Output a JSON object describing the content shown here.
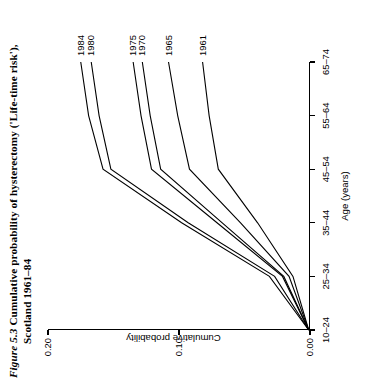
{
  "figure": {
    "number": "Figure 5.3",
    "caption_line1": "Cumulative probability of hysterectomy ('Life-time risk'),",
    "caption_line2": "Scotland 1961–84"
  },
  "chart_data": {
    "type": "line",
    "title": "Cumulative probability of hysterectomy ('Life-time risk'), Scotland 1961–84",
    "xlabel": "Age (years)",
    "ylabel": "Cumulative probability",
    "categories": [
      "10–24",
      "25–34",
      "35–44",
      "45–54",
      "55–64",
      "65–74"
    ],
    "ylim": [
      0.0,
      0.2
    ],
    "yticks": [
      "0.00",
      "0.10",
      "0.20"
    ],
    "ytick_values": [
      0.0,
      0.1,
      0.2
    ],
    "grid": false,
    "legend": "inline-end-labels",
    "series": [
      {
        "name": "1961",
        "values": [
          0.001,
          0.013,
          0.04,
          0.07,
          0.077,
          0.082
        ]
      },
      {
        "name": "1965",
        "values": [
          0.001,
          0.016,
          0.053,
          0.092,
          0.101,
          0.108
        ]
      },
      {
        "name": "1970",
        "values": [
          0.001,
          0.02,
          0.067,
          0.114,
          0.122,
          0.128
        ]
      },
      {
        "name": "1975",
        "values": [
          0.001,
          0.021,
          0.071,
          0.121,
          0.129,
          0.135
        ]
      },
      {
        "name": "1980",
        "values": [
          0.001,
          0.027,
          0.093,
          0.152,
          0.161,
          0.167
        ]
      },
      {
        "name": "1984",
        "values": [
          0.001,
          0.031,
          0.098,
          0.158,
          0.169,
          0.175
        ]
      }
    ]
  }
}
